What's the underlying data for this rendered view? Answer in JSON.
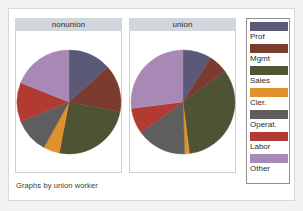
{
  "graph": {
    "caption": "Graphs by union worker",
    "background": "#ffffff",
    "frame_color": "#d8d8d8"
  },
  "legend": {
    "title": "",
    "border_color": "#8f8f8f",
    "entries": [
      {
        "label": "Prof",
        "color": "#5a5a78"
      },
      {
        "label": "Mgmt",
        "color": "#7b3b2e"
      },
      {
        "label": "Sales",
        "color": "#4f5233"
      },
      {
        "label": "Cler.",
        "color": "#e0912a"
      },
      {
        "label": "Operat.",
        "color": "#5e5e5e"
      },
      {
        "label": "Labor",
        "color": "#b23a33"
      },
      {
        "label": "Other",
        "color": "#a888b5"
      }
    ]
  },
  "panels": [
    {
      "title": "nonunion",
      "name": "nonunion",
      "slices": [
        {
          "category": "Prof",
          "percent": 13.5,
          "color": "#5a5a78"
        },
        {
          "category": "Mgmt",
          "percent": 14.5,
          "color": "#7b3b2e"
        },
        {
          "category": "Sales",
          "percent": 25.0,
          "color": "#4f5233"
        },
        {
          "category": "Cler.",
          "percent": 5.0,
          "color": "#e0912a"
        },
        {
          "category": "Operat.",
          "percent": 11.0,
          "color": "#5e5e5e"
        },
        {
          "category": "Labor",
          "percent": 12.0,
          "color": "#b23a33"
        },
        {
          "category": "Other",
          "percent": 19.0,
          "color": "#a888b5"
        }
      ]
    },
    {
      "title": "union",
      "name": "union",
      "slices": [
        {
          "category": "Prof",
          "percent": 9.0,
          "color": "#5a5a78"
        },
        {
          "category": "Mgmt",
          "percent": 6.0,
          "color": "#7b3b2e"
        },
        {
          "category": "Sales",
          "percent": 33.0,
          "color": "#4f5233"
        },
        {
          "category": "Cler.",
          "percent": 1.5,
          "color": "#e0912a"
        },
        {
          "category": "Operat.",
          "percent": 15.5,
          "color": "#5e5e5e"
        },
        {
          "category": "Labor",
          "percent": 8.0,
          "color": "#b23a33"
        },
        {
          "category": "Other",
          "percent": 27.0,
          "color": "#a888b5"
        }
      ]
    }
  ],
  "chart_data": {
    "type": "pie",
    "title": "",
    "subtitle": "",
    "xlabel": "",
    "ylabel": "",
    "note": "Graphs by union worker",
    "legend_position": "right",
    "grid": false,
    "categories": [
      "Prof",
      "Mgmt",
      "Sales",
      "Cler.",
      "Operat.",
      "Labor",
      "Other"
    ],
    "colors": [
      "#5a5a78",
      "#7b3b2e",
      "#4f5233",
      "#e0912a",
      "#5e5e5e",
      "#b23a33",
      "#a888b5"
    ],
    "panel_variable": "union worker",
    "panels": [
      {
        "panel": "nonunion",
        "values": [
          13.5,
          14.5,
          25.0,
          5.0,
          11.0,
          12.0,
          19.0
        ],
        "units": "percent"
      },
      {
        "panel": "union",
        "values": [
          9.0,
          6.0,
          33.0,
          1.5,
          15.5,
          8.0,
          27.0
        ],
        "units": "percent"
      }
    ]
  }
}
